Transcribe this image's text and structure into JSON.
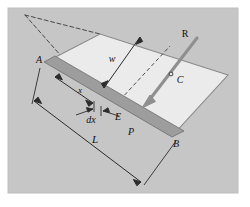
{
  "figure": {
    "background_color": "#ffffff",
    "frame_color": "#c9c9c9",
    "panel_color": "#c6c6c6",
    "plate_fill": "#ebebeb",
    "band_fill": "#9d9d9d",
    "line_color": "#3c3c3c",
    "arrow_color": "#8f8f8f"
  },
  "labels": {
    "point_a": "A",
    "point_b": "B",
    "point_c": "C",
    "point_e": "E",
    "point_p": "P",
    "force_r": "R",
    "width_w": "w",
    "dist_x": "x",
    "elem_dx": "dx",
    "length_l": "L"
  },
  "elements": {
    "plate_name": "inclined-plate",
    "band_name": "strip-element-band",
    "force_arrow_name": "resultant-force-arrow",
    "dim_w_name": "width-dimension",
    "dim_l_name": "length-dimension",
    "dim_x_name": "x-dimension",
    "dim_dx_name": "dx-dimension",
    "projection_lines_name": "projection-dashed-lines"
  }
}
